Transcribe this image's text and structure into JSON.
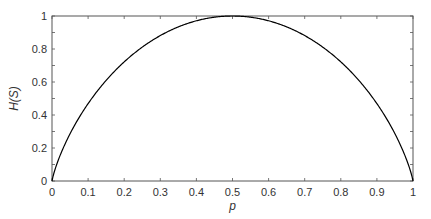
{
  "chart_data": {
    "type": "line",
    "title": "",
    "xlabel": "p",
    "ylabel": "H(S)",
    "xlim": [
      0,
      1
    ],
    "ylim": [
      0,
      1
    ],
    "grid": false,
    "legend": null,
    "x_ticks": [
      "0",
      "0.1",
      "0.2",
      "0.3",
      "0.4",
      "0.5",
      "0.6",
      "0.7",
      "0.8",
      "0.9",
      "1"
    ],
    "y_ticks": [
      "0",
      "0.2",
      "0.4",
      "0.6",
      "0.8",
      "1"
    ],
    "y_minor_ticks": [
      0.1,
      0.3,
      0.5,
      0.7,
      0.9
    ],
    "series": [
      {
        "name": "H(S)",
        "function": "binary entropy: -p*log2(p) - (1-p)*log2(1-p)",
        "color": "#000000",
        "x": [
          0,
          0.01,
          0.05,
          0.1,
          0.15,
          0.2,
          0.25,
          0.3,
          0.35,
          0.4,
          0.45,
          0.5,
          0.55,
          0.6,
          0.65,
          0.7,
          0.75,
          0.8,
          0.85,
          0.9,
          0.95,
          0.99,
          1
        ],
        "values": [
          0,
          0.081,
          0.286,
          0.469,
          0.61,
          0.722,
          0.811,
          0.881,
          0.934,
          0.971,
          0.993,
          1.0,
          0.993,
          0.971,
          0.934,
          0.881,
          0.811,
          0.722,
          0.61,
          0.469,
          0.286,
          0.081,
          0
        ]
      }
    ]
  },
  "plot_area": {
    "left": 52,
    "top": 16,
    "right": 413,
    "bottom": 181
  },
  "colors": {
    "axis": "#555555",
    "curve": "#000000",
    "text": "#333333"
  }
}
